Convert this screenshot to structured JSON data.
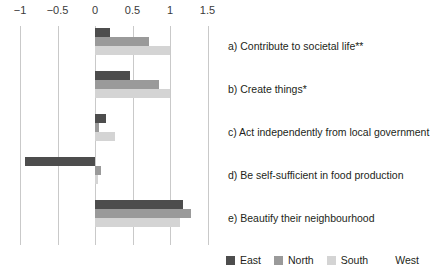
{
  "chart_data": {
    "type": "bar",
    "orientation": "horizontal",
    "title": "",
    "xlabel": "",
    "ylabel": "",
    "xlim": [
      -1.25,
      1.6
    ],
    "xticks": [
      -1,
      -0.5,
      0,
      0.5,
      1,
      1.5
    ],
    "xtick_labels": [
      "−1",
      "−0.5",
      "0",
      "0.5",
      "1",
      "1.5"
    ],
    "grid": true,
    "grid_axis": "x",
    "legend_position": "bottom-right",
    "categories": [
      "a) Contribute to societal life**",
      "b) Create things*",
      "c) Act independently from local government",
      "d) Be self-sufficient in food production",
      "e) Beautify their neighbourhood"
    ],
    "series": [
      {
        "name": "East",
        "color": "#4d4d4d",
        "values": [
          0.2,
          0.47,
          0.14,
          -0.93,
          1.17
        ]
      },
      {
        "name": "North",
        "color": "#9a9a9a",
        "values": [
          0.72,
          0.85,
          0.05,
          0.08,
          1.28
        ]
      },
      {
        "name": "South",
        "color": "#d4d4d4",
        "values": [
          1.0,
          1.0,
          0.26,
          0.04,
          1.13
        ]
      },
      {
        "name": "West",
        "color": "#ffffff",
        "values": [
          0.0,
          0.0,
          0.0,
          0.0,
          0.0
        ]
      }
    ]
  },
  "legend": {
    "entries": [
      {
        "label": "East"
      },
      {
        "label": "North"
      },
      {
        "label": "South"
      },
      {
        "label": "West"
      }
    ]
  }
}
